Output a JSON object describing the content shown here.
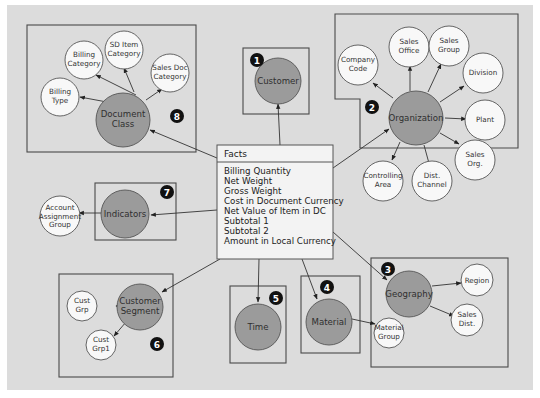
{
  "diagram": {
    "type": "star-schema",
    "facts": {
      "title": "Facts",
      "items": [
        "Billing Quantity",
        "Net Weight",
        "Gross Weight",
        "Cost in Document Currency",
        "Net Value of Item in DC",
        "Subtotal 1",
        "Subtotal 2",
        "Amount in Local Currency"
      ]
    },
    "dimensions": [
      {
        "badge": "1",
        "name": "Customer",
        "attributes": []
      },
      {
        "badge": "2",
        "name": "Organization",
        "attributes": [
          "Company Code",
          "Sales Office",
          "Sales Group",
          "Division",
          "Plant",
          "Sales Org.",
          "Dist. Channel",
          "Controlling Area"
        ]
      },
      {
        "badge": "3",
        "name": "Geography",
        "attributes": [
          "Region",
          "Sales Dist."
        ]
      },
      {
        "badge": "4",
        "name": "Material",
        "attributes": [
          "Material Group"
        ]
      },
      {
        "badge": "5",
        "name": "Time",
        "attributes": []
      },
      {
        "badge": "6",
        "name": "Customer Segment",
        "attributes": [
          "Cust Grp",
          "Cust Grp1"
        ]
      },
      {
        "badge": "7",
        "name": "Indicators",
        "attributes": [
          "Account Assignment Group"
        ]
      },
      {
        "badge": "8",
        "name": "Document Class",
        "attributes": [
          "Billing Type",
          "Billing Category",
          "SD Item Category",
          "Sales Doc Category"
        ]
      }
    ],
    "colors": {
      "background": "#dcdcdc",
      "dimension_fill": "#9b9b9b",
      "attribute_fill": "#f8f8f8",
      "badge": "#111111"
    }
  }
}
